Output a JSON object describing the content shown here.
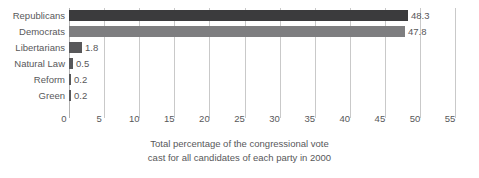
{
  "chart_data": {
    "type": "bar",
    "orientation": "horizontal",
    "title": "",
    "subtitle": "",
    "xlabel": "",
    "ylabel": "",
    "categories": [
      "Republicans",
      "Democrats",
      "Libertarians",
      "Natural Law",
      "Reform",
      "Green"
    ],
    "values": [
      48.3,
      47.8,
      1.8,
      0.5,
      0.2,
      0.2
    ],
    "value_labels": [
      "48.3",
      "47.8",
      "1.8",
      "0.5",
      "0.2",
      "0.2"
    ],
    "bar_colors": [
      "#3b3b3d",
      "#7e7e80",
      "#58585a",
      "#58585a",
      "#58585a",
      "#58585a"
    ],
    "xlim": [
      0,
      55
    ],
    "xticks": [
      0,
      5,
      10,
      15,
      20,
      25,
      30,
      35,
      40,
      45,
      50,
      55
    ],
    "xtick_labels": [
      "0",
      "5",
      "10",
      "15",
      "20",
      "25",
      "30",
      "35",
      "40",
      "45",
      "50",
      "55"
    ],
    "grid": true,
    "grid_axis": "x",
    "legend": null,
    "caption_lines": [
      "Total percentage of the congressional vote",
      "cast for all candidates of each party in 2000"
    ]
  },
  "caption": {
    "line1": "Total percentage of the congressional vote",
    "line2": "cast for all candidates of each party in 2000"
  },
  "colors": {
    "republican_bar": "#3b3b3d",
    "democrat_bar": "#7e7e80",
    "minor_bar": "#58585a",
    "gridline": "#c9c9c9",
    "text": "#58585a",
    "background": "#ffffff"
  }
}
